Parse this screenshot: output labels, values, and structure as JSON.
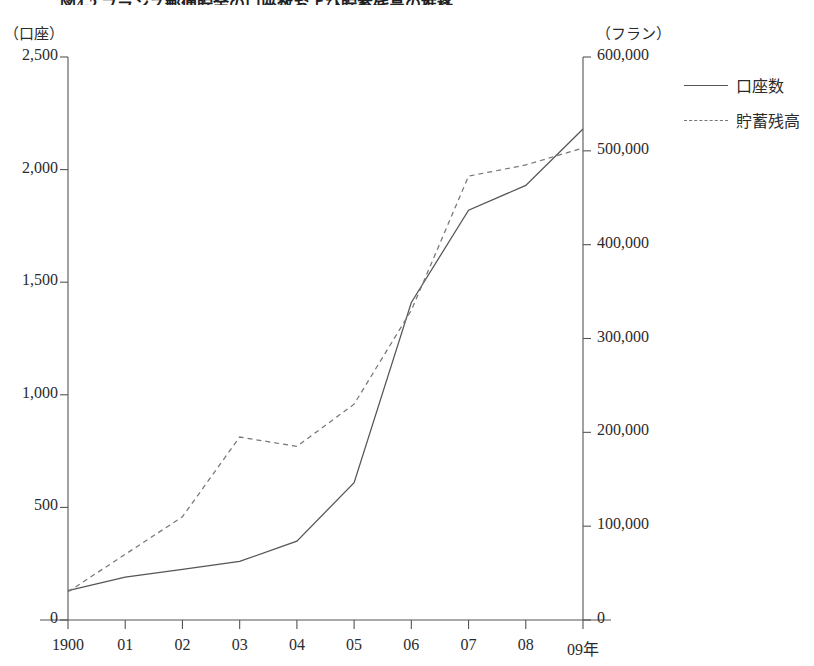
{
  "title": "図4-2 フランス郵便貯金の口座数および貯蓄残高の推移",
  "axes": {
    "left_unit": "（口座）",
    "right_unit": "（フラン）",
    "left_ticks": [
      "2,500",
      "2,000",
      "1,500",
      "1,000",
      "500",
      "0"
    ],
    "right_ticks": [
      "600,000",
      "500,000",
      "400,000",
      "300,000",
      "200,000",
      "100,000",
      "0"
    ],
    "x_ticks": [
      "1900",
      "01",
      "02",
      "03",
      "04",
      "05",
      "06",
      "07",
      "08",
      "09年"
    ]
  },
  "legend": {
    "items": [
      {
        "label": "口座数",
        "style": "solid"
      },
      {
        "label": "貯蓄残高",
        "style": "dashed"
      }
    ]
  },
  "chart_data": {
    "type": "line",
    "title": "図4-2 フランス郵便貯金の口座数および貯蓄残高の推移",
    "xlabel": "年",
    "ylabel": "口座",
    "y2label": "フラン",
    "categories": [
      "1900",
      "01",
      "02",
      "03",
      "04",
      "05",
      "06",
      "07",
      "08",
      "09"
    ],
    "x": [
      1900,
      1901,
      1902,
      1903,
      1904,
      1905,
      1906,
      1907,
      1908,
      1909
    ],
    "ylim": [
      0,
      2500
    ],
    "y2lim": [
      0,
      600000
    ],
    "grid": false,
    "legend_position": "top-right",
    "series": [
      {
        "name": "口座数",
        "style": "solid",
        "axis": "left",
        "unit": "口座",
        "values": [
          130,
          190,
          225,
          260,
          350,
          610,
          1410,
          1820,
          1930,
          2180
        ]
      },
      {
        "name": "貯蓄残高",
        "style": "dashed",
        "axis": "right",
        "unit": "フラン",
        "values": [
          30000,
          70000,
          110000,
          195000,
          185000,
          230000,
          330000,
          473000,
          485000,
          503000
        ]
      }
    ]
  },
  "colors": {
    "line_solid": "#555555",
    "line_dashed": "#777777",
    "axis": "#555555",
    "text": "#2b2b2b",
    "background": "#ffffff"
  }
}
